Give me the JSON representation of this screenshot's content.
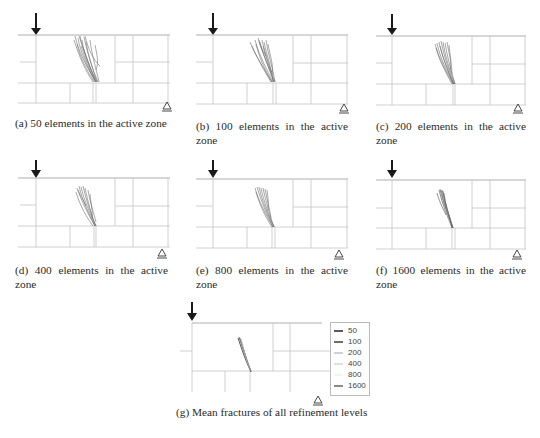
{
  "figure": {
    "panels": [
      {
        "id": "a",
        "caption": "(a) 50 elements in the active zone",
        "elements": 50
      },
      {
        "id": "b",
        "caption": "(b) 100 elements in the active zone",
        "elements": 100
      },
      {
        "id": "c",
        "caption": "(c) 200 elements in the active zone",
        "elements": 200
      },
      {
        "id": "d",
        "caption": "(d) 400 elements in the active zone",
        "elements": 400
      },
      {
        "id": "e",
        "caption": "(e) 800 elements in the active zone",
        "elements": 800
      },
      {
        "id": "f",
        "caption": "(f) 1600 elements in the active zone",
        "elements": 1600
      },
      {
        "id": "g",
        "caption": "(g) Mean fractures of all refinement levels"
      }
    ],
    "legend": {
      "items": [
        {
          "label": "50",
          "color": "#5a5a5a"
        },
        {
          "label": "100",
          "color": "#6e6e6e"
        },
        {
          "label": "200",
          "color": "#d0d0d0"
        },
        {
          "label": "400",
          "color": "#e0e0e0"
        },
        {
          "label": "800",
          "color": "#f0f0f0"
        },
        {
          "label": "1600",
          "color": "#8a8a8a"
        }
      ]
    },
    "icons": {
      "load": "down-arrow-load",
      "support": "triangle-roller-support"
    },
    "colors": {
      "grid_line": "#bdbdbd",
      "beam_top": "#9a9a9a",
      "crack": "#555555",
      "arrow": "#1a1a1a"
    }
  }
}
